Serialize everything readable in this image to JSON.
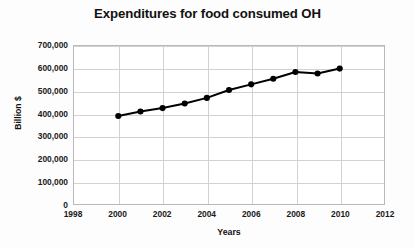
{
  "chart_data": {
    "type": "line",
    "title": "Expenditures for food consumed OH",
    "xlabel": "Years",
    "ylabel": "Billion $",
    "grid": true,
    "legend": false,
    "legend_position": "none",
    "xlim": [
      1998,
      2012
    ],
    "ylim": [
      0,
      700000
    ],
    "xticks": [
      1998,
      2000,
      2002,
      2004,
      2006,
      2008,
      2010,
      2012
    ],
    "xtick_labels": [
      "1998",
      "2000",
      "2002",
      "2004",
      "2006",
      "2008",
      "2010",
      "2012"
    ],
    "yticks": [
      0,
      100000,
      200000,
      300000,
      400000,
      500000,
      600000,
      700000
    ],
    "ytick_labels": [
      "0",
      "100,000",
      "200,000",
      "300,000",
      "400,000",
      "500,000",
      "600,000",
      "700,000"
    ],
    "x": [
      2000,
      2001,
      2002,
      2003,
      2004,
      2005,
      2006,
      2007,
      2008,
      2009,
      2010
    ],
    "values": [
      390000,
      410000,
      425000,
      445000,
      470000,
      505000,
      530000,
      555000,
      585000,
      578000,
      600000
    ],
    "series": [
      {
        "name": "Expenditures",
        "color": "#000000",
        "marker": "circle",
        "line_width": 2,
        "values": [
          390000,
          410000,
          425000,
          445000,
          470000,
          505000,
          530000,
          555000,
          585000,
          578000,
          600000
        ]
      }
    ]
  },
  "style": {
    "plot_background": "#ffffff",
    "figure_background": "#fdfdfd",
    "grid_color": "#d2d2d2",
    "frame_color": "#b9b9b9",
    "text_color": "#111111",
    "series_color": "#000000"
  }
}
